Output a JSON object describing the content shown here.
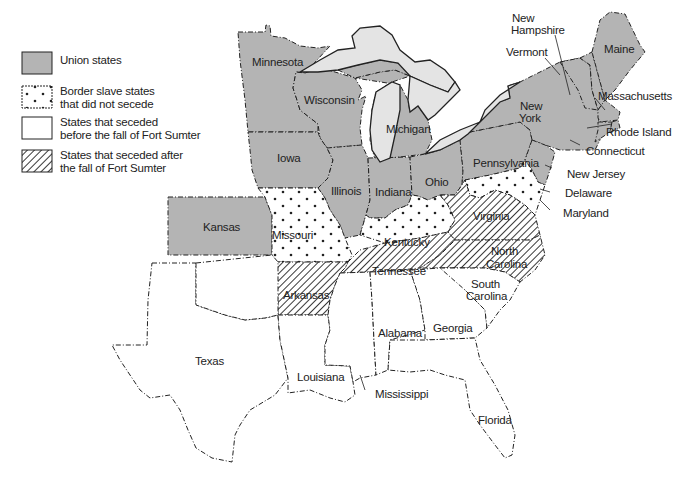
{
  "map": {
    "type": "thematic-map",
    "region": "Eastern United States, 1861",
    "colors": {
      "union": "#b4b4b4",
      "border": "#ffffff",
      "seceded_before": "#ffffff",
      "seceded_after_hatch": "#222222",
      "water": "#e4e4e4",
      "outline": "#222222"
    }
  },
  "legend": {
    "items": [
      {
        "key": "union",
        "label_lines": [
          "Union states"
        ]
      },
      {
        "key": "border",
        "label_lines": [
          "Border slave states",
          "that did not secede"
        ]
      },
      {
        "key": "before",
        "label_lines": [
          "States that seceded",
          "before the fall of Fort Sumter"
        ]
      },
      {
        "key": "after",
        "label_lines": [
          "States that seceded after",
          "the fall of Fort Sumter"
        ]
      }
    ]
  },
  "states": {
    "union": [
      "Minnesota",
      "Wisconsin",
      "Michigan",
      "Iowa",
      "Illinois",
      "Indiana",
      "Ohio",
      "Pennsylvania",
      "New York",
      "Kansas",
      "Maine",
      "New Hampshire",
      "Vermont",
      "Massachusetts",
      "Rhode Island",
      "Connecticut",
      "New Jersey"
    ],
    "border": [
      "Missouri",
      "Kentucky",
      "Delaware",
      "Maryland"
    ],
    "seceded_before": [
      "Texas",
      "Louisiana",
      "Mississippi",
      "Alabama",
      "Georgia",
      "Florida",
      "South Carolina"
    ],
    "seceded_after": [
      "Virginia",
      "North Carolina",
      "Tennessee",
      "Arkansas"
    ]
  },
  "labels": {
    "minnesota": "Minnesota",
    "wisconsin": "Wisconsin",
    "michigan": "Michigan",
    "iowa": "Iowa",
    "illinois": "Illinois",
    "indiana": "Indiana",
    "ohio": "Ohio",
    "pennsylvania": "Pennsylvania",
    "new_york_1": "New",
    "new_york_2": "York",
    "kansas": "Kansas",
    "missouri": "Missouri",
    "kentucky": "Kentucky",
    "virginia": "Virginia",
    "tennessee": "Tennessee",
    "north_carolina_1": "North",
    "north_carolina_2": "Carolina",
    "south_carolina_1": "South",
    "south_carolina_2": "Carolina",
    "arkansas": "Arkansas",
    "texas": "Texas",
    "louisiana": "Louisiana",
    "mississippi": "Mississippi",
    "alabama": "Alabama",
    "georgia": "Georgia",
    "florida": "Florida",
    "maine": "Maine",
    "new_hampshire_1": "New",
    "new_hampshire_2": "Hampshire",
    "vermont": "Vermont",
    "massachusetts": "Massachusetts",
    "rhode_island": "Rhode Island",
    "connecticut": "Connecticut",
    "new_jersey": "New Jersey",
    "delaware": "Delaware",
    "maryland": "Maryland"
  }
}
